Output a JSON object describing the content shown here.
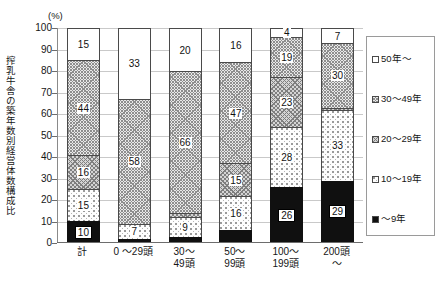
{
  "chart_data": {
    "type": "bar",
    "subtype": "stacked-bar-100",
    "title": "",
    "unit_label": "(%)",
    "ylabel": "搾乳牛舎の築年数別経営体数構成比",
    "xlabel": "",
    "ylim": [
      0,
      100
    ],
    "yticks": [
      0,
      10,
      20,
      30,
      40,
      50,
      60,
      70,
      80,
      90,
      100
    ],
    "grid": true,
    "legend_position": "right",
    "categories": [
      "計",
      "0〜29頭",
      "30〜49頭",
      "50〜99頭",
      "100〜199頭",
      "200頭〜"
    ],
    "category_lines": [
      [
        "計"
      ],
      [
        "0 〜29頭"
      ],
      [
        "30〜",
        "49頭"
      ],
      [
        "50〜",
        "99頭"
      ],
      [
        "100〜",
        "199頭"
      ],
      [
        "200頭",
        "〜"
      ]
    ],
    "series": [
      {
        "name": "〜9年",
        "pattern": "solid-black",
        "values": [
          10,
          2,
          3,
          6,
          26,
          29
        ],
        "labels": [
          "10",
          "",
          "",
          "",
          "26",
          "29"
        ]
      },
      {
        "name": "10〜19年",
        "pattern": "sparse-dots",
        "values": [
          15,
          7,
          9,
          16,
          28,
          33
        ],
        "labels": [
          "15",
          "7",
          "9",
          "16",
          "28",
          "33"
        ]
      },
      {
        "name": "20〜29年",
        "pattern": "medium-crosshatch",
        "values": [
          16,
          0,
          2,
          15,
          23,
          1
        ],
        "labels": [
          "16",
          "",
          "",
          "15",
          "23",
          ""
        ]
      },
      {
        "name": "30〜49年",
        "pattern": "dense-crosshatch",
        "values": [
          44,
          58,
          66,
          47,
          19,
          30
        ],
        "labels": [
          "44",
          "58",
          "66",
          "47",
          "19",
          "30"
        ]
      },
      {
        "name": "50年〜",
        "pattern": "white",
        "values": [
          15,
          33,
          20,
          16,
          4,
          7
        ],
        "labels": [
          "15",
          "33",
          "20",
          "16",
          "4",
          "7"
        ]
      }
    ],
    "legend_entries": [
      {
        "label": "50年〜",
        "pattern": "white"
      },
      {
        "label": "30〜49年",
        "pattern": "dense-crosshatch"
      },
      {
        "label": "20〜29年",
        "pattern": "medium-crosshatch"
      },
      {
        "label": "10〜19年",
        "pattern": "sparse-dots"
      },
      {
        "label": "〜9年",
        "pattern": "solid-black"
      }
    ]
  }
}
